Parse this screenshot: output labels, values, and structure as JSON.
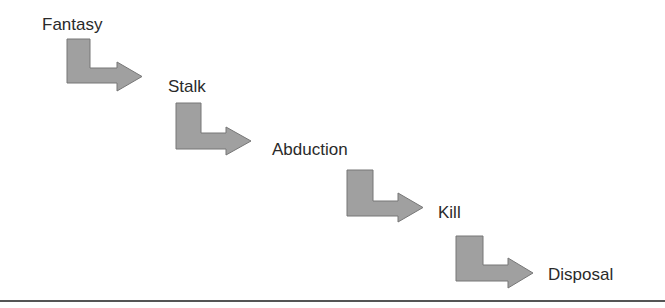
{
  "diagram": {
    "type": "stepwise-flow",
    "stages": [
      {
        "label": "Fantasy",
        "x": 42,
        "y": 16
      },
      {
        "label": "Stalk",
        "x": 168,
        "y": 78
      },
      {
        "label": "Abduction",
        "x": 272,
        "y": 141
      },
      {
        "label": "Kill",
        "x": 438,
        "y": 204
      },
      {
        "label": "Disposal",
        "x": 548,
        "y": 266
      }
    ],
    "connectors": [
      {
        "from": "Fantasy",
        "to": "Stalk",
        "left": 67,
        "top": 39,
        "bar_right": 90,
        "shaft_top": 68,
        "shaft_bottom": 83,
        "head_top": 62,
        "head_bottom": 91,
        "head_start": 117,
        "tip": 142
      },
      {
        "from": "Stalk",
        "to": "Abduction",
        "left": 176,
        "top": 103,
        "bar_right": 201,
        "shaft_top": 133,
        "shaft_bottom": 149,
        "head_top": 127,
        "head_bottom": 155,
        "head_start": 226,
        "tip": 251
      },
      {
        "from": "Abduction",
        "to": "Kill",
        "left": 347,
        "top": 170,
        "bar_right": 373,
        "shaft_top": 201,
        "shaft_bottom": 216,
        "head_top": 193,
        "head_bottom": 222,
        "head_start": 398,
        "tip": 423
      },
      {
        "from": "Kill",
        "to": "Disposal",
        "left": 456,
        "top": 236,
        "bar_right": 483,
        "shaft_top": 265,
        "shaft_bottom": 281,
        "head_top": 258,
        "head_bottom": 288,
        "head_start": 508,
        "tip": 533
      }
    ],
    "colors": {
      "arrow_fill": "#a0a0a0",
      "arrow_stroke": "#777777",
      "text": "#2a2a2a",
      "rule": "#555555"
    }
  }
}
